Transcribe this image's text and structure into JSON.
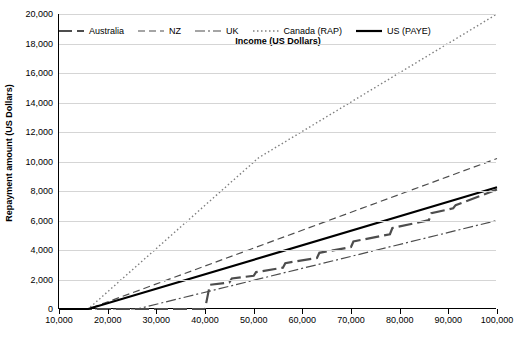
{
  "chart_data": {
    "type": "line",
    "title": "",
    "xlabel": "Income (US Dollars)",
    "ylabel": "Repayment amount (US Dollars)",
    "xlim": [
      10000,
      100000
    ],
    "ylim": [
      0,
      20000
    ],
    "xticks": [
      "10,000",
      "20,000",
      "30,000",
      "40,000",
      "50,000",
      "60,000",
      "70,000",
      "80,000",
      "90,000",
      "100,000"
    ],
    "xtick_values": [
      10000,
      20000,
      30000,
      40000,
      50000,
      60000,
      70000,
      80000,
      90000,
      100000
    ],
    "yticks": [
      "0",
      "2,000",
      "4,000",
      "6,000",
      "8,000",
      "10,000",
      "12,000",
      "14,000",
      "16,000",
      "18,000",
      "20,000"
    ],
    "ytick_values": [
      0,
      2000,
      4000,
      6000,
      8000,
      10000,
      12000,
      14000,
      16000,
      18000,
      20000
    ],
    "grid": true,
    "legend_position": "top",
    "series": [
      {
        "name": "Australia",
        "dash": "14,5",
        "width": 2.2,
        "color": "#4d4d4d",
        "x": [
          10000,
          16000,
          35000,
          40000,
          41000,
          45000,
          45500,
          50000,
          50500,
          56000,
          56500,
          63000,
          63500,
          70000,
          70500,
          78000,
          78500,
          86000,
          86500,
          91000,
          91500,
          100000
        ],
        "y": [
          0,
          0,
          0,
          0,
          1640,
          1800,
          2070,
          2250,
          2500,
          2800,
          3110,
          3460,
          3810,
          4200,
          4580,
          5070,
          5490,
          6020,
          6490,
          6830,
          7040,
          8100
        ]
      },
      {
        "name": "NZ",
        "dash": "7,4",
        "width": 1.2,
        "color": "#4d4d4d",
        "x": [
          10000,
          16000,
          100000
        ],
        "y": [
          0,
          0,
          10200
        ]
      },
      {
        "name": "UK",
        "dash": "10,3,2,3",
        "width": 1.2,
        "color": "#4d4d4d",
        "x": [
          10000,
          26000,
          100000
        ],
        "y": [
          0,
          0,
          6000
        ]
      },
      {
        "name": "Canada (RAP)",
        "dash": "1.5,2.5",
        "width": 1.4,
        "color": "#808080",
        "x": [
          10000,
          16000,
          51000,
          100000
        ],
        "y": [
          0,
          0,
          10250,
          20000
        ]
      },
      {
        "name": "US (PAYE)",
        "dash": "none",
        "width": 2.2,
        "color": "#000000",
        "x": [
          10000,
          16000,
          100000
        ],
        "y": [
          0,
          0,
          8250
        ]
      }
    ]
  }
}
